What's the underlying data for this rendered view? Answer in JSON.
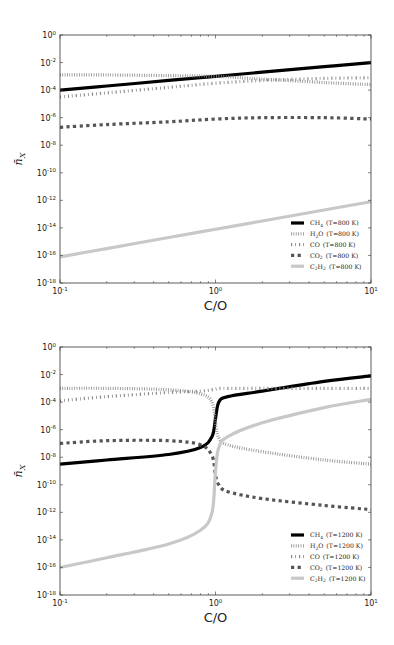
{
  "chart_data": [
    {
      "type": "line",
      "title": "",
      "xlabel": "C/O",
      "ylabel": "n̄_X",
      "xscale": "log",
      "yscale": "log",
      "xlim": [
        0.1,
        10
      ],
      "ylim": [
        1e-18,
        1
      ],
      "x_tick_labels": [
        "10^-1",
        "10^0",
        "10^1"
      ],
      "y_tick_labels": [
        "10^0",
        "10^-2",
        "10^-4",
        "10^-6",
        "10^-8",
        "10^-10",
        "10^-12",
        "10^-14",
        "10^-16",
        "10^-18"
      ],
      "grid": false,
      "legend_position": "lower right",
      "x": [
        0.1,
        0.2,
        0.5,
        1,
        2,
        5,
        10
      ],
      "series": [
        {
          "name": "CH4 (T=800 K)",
          "label_main": "CH",
          "label_sub": "4",
          "label_temp": "(T=800 K)",
          "style": "solid-thick-black",
          "color": "#000000",
          "log10_values": [
            -4.0,
            -3.7,
            -3.3,
            -3.0,
            -2.7,
            -2.3,
            -2.0
          ]
        },
        {
          "name": "H2O (T=800 K)",
          "label_main": "H",
          "label_sub": "2",
          "label_post": "O",
          "label_temp": "(T=800 K)",
          "style": "dotted-ticks",
          "color": "#888888",
          "log10_values": [
            -2.9,
            -2.9,
            -2.95,
            -3.0,
            -3.2,
            -3.45,
            -3.6
          ]
        },
        {
          "name": "CO (T=800 K)",
          "label_main": "CO",
          "label_temp": "(T=800 K)",
          "style": "dash-dot-ticks",
          "color": "#888888",
          "log10_values": [
            -4.5,
            -4.2,
            -3.8,
            -3.5,
            -3.3,
            -3.15,
            -3.1
          ]
        },
        {
          "name": "CO2 (T=800 K)",
          "label_main": "CO",
          "label_sub": "2",
          "label_temp": "(T=800 K)",
          "style": "dashed-squares",
          "color": "#555555",
          "log10_values": [
            -6.7,
            -6.5,
            -6.3,
            -6.1,
            -6.0,
            -6.0,
            -6.1
          ]
        },
        {
          "name": "C2H2 (T=800 K)",
          "label_main": "C",
          "label_sub": "2",
          "label_post": "H",
          "label_sub2": "2",
          "label_temp": "(T=800 K)",
          "style": "solid-thick-lightgray",
          "color": "#c8c8c8",
          "log10_values": [
            -16.1,
            -15.5,
            -14.7,
            -14.1,
            -13.5,
            -12.7,
            -12.1
          ]
        }
      ]
    },
    {
      "type": "line",
      "title": "",
      "xlabel": "C/O",
      "ylabel": "n̄_X",
      "xscale": "log",
      "yscale": "log",
      "xlim": [
        0.1,
        10
      ],
      "ylim": [
        1e-18,
        1
      ],
      "x_tick_labels": [
        "10^-1",
        "10^0",
        "10^1"
      ],
      "y_tick_labels": [
        "10^0",
        "10^-2",
        "10^-4",
        "10^-6",
        "10^-8",
        "10^-10",
        "10^-12",
        "10^-14",
        "10^-16",
        "10^-18"
      ],
      "grid": false,
      "legend_position": "lower right",
      "x": [
        0.1,
        0.2,
        0.5,
        0.8,
        0.95,
        1.0,
        1.05,
        1.2,
        2,
        5,
        10
      ],
      "series": [
        {
          "name": "CH4 (T=1200 K)",
          "label_main": "CH",
          "label_sub": "4",
          "label_temp": "(T=1200 K)",
          "style": "solid-thick-black",
          "color": "#000000",
          "log10_values": [
            -8.5,
            -8.2,
            -7.8,
            -7.3,
            -6.5,
            -5.2,
            -4.0,
            -3.6,
            -3.2,
            -2.5,
            -2.1
          ]
        },
        {
          "name": "H2O (T=1200 K)",
          "label_main": "H",
          "label_sub": "2",
          "label_post": "O",
          "label_temp": "(T=1200 K)",
          "style": "dotted-ticks",
          "color": "#888888",
          "log10_values": [
            -3.0,
            -3.0,
            -3.1,
            -3.4,
            -4.0,
            -5.5,
            -6.6,
            -7.1,
            -7.6,
            -8.2,
            -8.5
          ]
        },
        {
          "name": "CO (T=1200 K)",
          "label_main": "CO",
          "label_temp": "(T=1200 K)",
          "style": "dash-dot-ticks",
          "color": "#888888",
          "log10_values": [
            -3.9,
            -3.6,
            -3.3,
            -3.2,
            -3.1,
            -3.05,
            -3.0,
            -3.0,
            -3.0,
            -3.0,
            -3.0
          ]
        },
        {
          "name": "CO2 (T=1200 K)",
          "label_main": "CO",
          "label_sub": "2",
          "label_temp": "(T=1200 K)",
          "style": "dashed-squares",
          "color": "#555555",
          "log10_values": [
            -7.0,
            -6.8,
            -6.8,
            -7.1,
            -7.9,
            -9.3,
            -10.0,
            -10.5,
            -11.0,
            -11.5,
            -11.8
          ]
        },
        {
          "name": "C2H2 (T=1200 K)",
          "label_main": "C",
          "label_sub": "2",
          "label_post": "H",
          "label_sub2": "2",
          "label_temp": "(T=1200 K)",
          "style": "solid-thick-lightgray",
          "color": "#c8c8c8",
          "log10_values": [
            -16.0,
            -15.3,
            -14.3,
            -13.3,
            -12.0,
            -9.0,
            -7.3,
            -6.5,
            -5.5,
            -4.4,
            -3.8
          ]
        }
      ]
    }
  ]
}
